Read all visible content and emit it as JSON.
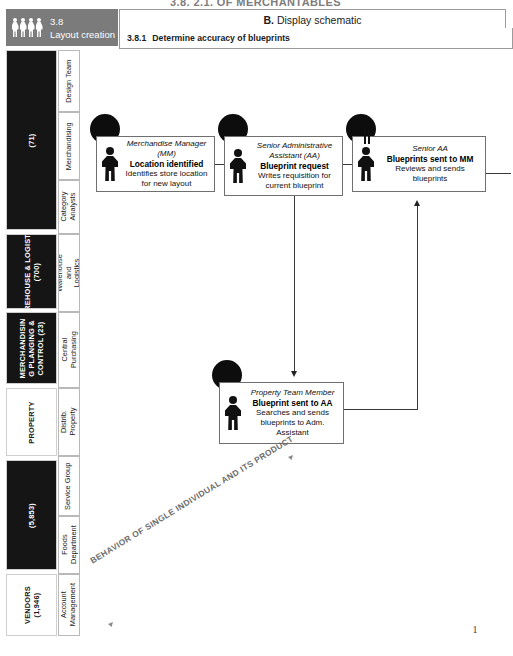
{
  "document": {
    "top_title": "3.8. 2.1.  OF MERCHANTABLES",
    "page_number": "1"
  },
  "header": {
    "process_number": "3.8",
    "process_name": "Layout creation",
    "people_icon": "people-group-icon",
    "title_prefix": "B.",
    "title_text": "Display schematic",
    "sub_number": "3.8.1",
    "sub_text": "Determine accuracy of blueprints"
  },
  "sidebar": {
    "departments": [
      {
        "name": "",
        "count": "(71)",
        "style": "dark"
      },
      {
        "name": "WAREHOUSE & LOGISTICS",
        "count": "(700)",
        "style": "dark"
      },
      {
        "name": "MERCHANDISIN G PLANGING & CONTROL (23)",
        "count": "",
        "style": "dark"
      },
      {
        "name": "PROPERTY",
        "count": "",
        "style": "light"
      },
      {
        "name": "",
        "count": "(5,853)",
        "style": "dark"
      },
      {
        "name": "VENDORS",
        "count": "(1,946)",
        "style": "light"
      }
    ],
    "lanes": [
      {
        "label": "Design Team"
      },
      {
        "label": "Merchandising"
      },
      {
        "label": "Category Analysts"
      },
      {
        "label": "Warehouse and Logistics"
      },
      {
        "label": "Central Purchasing"
      },
      {
        "label": "Distrib. Property"
      },
      {
        "label": "Service Group"
      },
      {
        "label": "Foods Department"
      },
      {
        "label": "Account Management"
      }
    ]
  },
  "flow": {
    "steps": [
      {
        "id": "step-location-identified",
        "role": "Merchandise Manager (MM)",
        "action": "Location identified",
        "description": "Identifies store location for new layout",
        "figure_icon": "person-figure-icon"
      },
      {
        "id": "step-blueprint-request",
        "role": "Senior Administrative Assistant (AA)",
        "action": "Blueprint request",
        "description": "Writes requisition for current blueprint",
        "figure_icon": "person-figure-icon"
      },
      {
        "id": "step-blueprints-sent-to-mm",
        "role": "Senior AA",
        "action": "Blueprints sent to MM",
        "description": "Reviews and sends blueprints",
        "figure_icon": "person-figure-icon"
      },
      {
        "id": "step-blueprint-sent-to-aa",
        "role": "Property Team Member",
        "action": "Blueprint sent to AA",
        "description": "Searches and sends blueprints to  Adm. Assistant",
        "figure_icon": "person-figure-icon"
      }
    ]
  },
  "annotation": {
    "diagonal_label": "BEHAVIOR OF SINGLE INDIVIDUAL AND ITS PRODUCT"
  },
  "colors": {
    "header_gray": "#7b7b7b",
    "dept_dark": "#151515",
    "line": "#3a3a3a",
    "watermark": "#6d6d6d"
  }
}
